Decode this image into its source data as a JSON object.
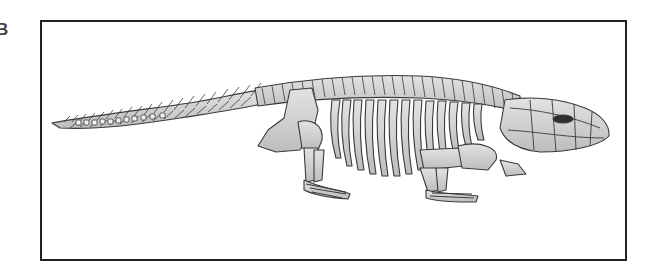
{
  "figure": {
    "panel_label": "B",
    "orientation": "head facing right, tail to left",
    "parts": [
      "tail vertebrae",
      "dorsal vertebral column",
      "ribs",
      "pelvic girdle",
      "hind limb",
      "hind foot",
      "shoulder girdle",
      "fore limb",
      "fore foot",
      "skull",
      "orbit"
    ],
    "colors": {
      "frame": "#222222",
      "bone_fill": "#d4d4d4",
      "bone_outline": "#3a3a3a",
      "orbit": "#2f2f2f",
      "background": "#ffffff"
    }
  }
}
